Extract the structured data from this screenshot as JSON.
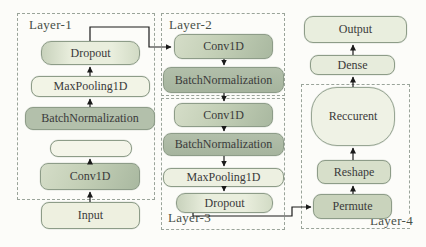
{
  "diagram": {
    "layers": {
      "layer1": {
        "label": "Layer-1",
        "nodes": {
          "dropout": "Dropout",
          "maxpooling": "MaxPooling1D",
          "batchnorm": "BatchNormalization",
          "blank": "",
          "conv": "Conv1D"
        }
      },
      "layer2": {
        "label": "Layer-2",
        "nodes": {
          "conv": "Conv1D",
          "batchnorm": "BatchNormalization"
        }
      },
      "layer3": {
        "label": "Layer-3",
        "nodes": {
          "conv": "Conv1D",
          "batchnorm": "BatchNormalization",
          "maxpooling": "MaxPooling1D",
          "dropout": "Dropout"
        }
      },
      "layer4": {
        "label": "Layer-4",
        "nodes": {
          "recurrent": "Reccurent",
          "reshape": "Reshape",
          "permute": "Permute"
        }
      }
    },
    "io": {
      "input": "Input",
      "dense": "Dense",
      "output": "Output"
    },
    "colors": {
      "box_border": "#8d9c88",
      "dashed_border": "#9aa49a",
      "cream_fill": "#f2f4e6",
      "light_fill": "#e8edde",
      "medium_fill": "#b7c4ad",
      "dark_fill": "#a9b7a1",
      "arrow": "#1a1a1a",
      "text": "#3a3a3a"
    }
  }
}
